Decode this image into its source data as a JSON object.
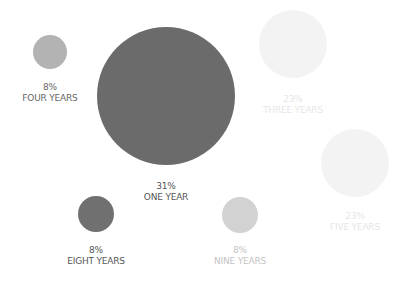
{
  "chart_data": {
    "type": "bubble",
    "title": "",
    "grid": false,
    "legend": "none",
    "series": [
      {
        "name": "ONE YEAR",
        "value": 31,
        "label": "31%",
        "color": "#6b6b6b",
        "cx": 166,
        "cy": 96,
        "r": 69,
        "label_x": 166,
        "label_y": 181,
        "label_color": "#555555"
      },
      {
        "name": "FOUR YEARS",
        "value": 8,
        "label": "8%",
        "color": "#b3b3b3",
        "cx": 50,
        "cy": 52,
        "r": 17,
        "label_x": 50,
        "label_y": 82,
        "label_color": "#666666"
      },
      {
        "name": "THREE YEARS",
        "value": 23,
        "label": "23%",
        "color": "#f3f3f3",
        "cx": 293,
        "cy": 44,
        "r": 34,
        "label_x": 293,
        "label_y": 94,
        "label_color": "#e6e6e6"
      },
      {
        "name": "FIVE YEARS",
        "value": 23,
        "label": "23%",
        "color": "#f3f3f3",
        "cx": 355,
        "cy": 163,
        "r": 34,
        "label_x": 355,
        "label_y": 211,
        "label_color": "#e6e6e6"
      },
      {
        "name": "EIGHT YEARS",
        "value": 8,
        "label": "8%",
        "color": "#707070",
        "cx": 96,
        "cy": 214,
        "r": 18,
        "label_x": 96,
        "label_y": 245,
        "label_color": "#555555"
      },
      {
        "name": "NINE YEARS",
        "value": 8,
        "label": "8%",
        "color": "#d2d2d2",
        "cx": 240,
        "cy": 215,
        "r": 18,
        "label_x": 240,
        "label_y": 245,
        "label_color": "#c4c4c4"
      }
    ]
  }
}
